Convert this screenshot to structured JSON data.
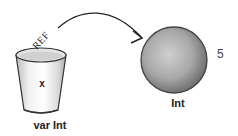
{
  "diagram": {
    "variable": {
      "container_label": "var Int",
      "name": "x",
      "reference_label": "REF"
    },
    "object": {
      "type_label": "Int",
      "value": "5"
    },
    "arrow": {
      "from": "variable",
      "to": "object",
      "icon": "curved-arrow-icon"
    },
    "colors": {
      "ink": "#222222",
      "cup_fill": "#e8e8e8",
      "ball_fill": "#a9a9a9",
      "ball_edge": "#555555"
    }
  }
}
